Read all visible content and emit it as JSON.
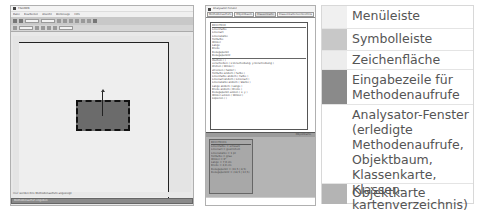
{
  "left_window": {
    "title": "FIGUREN",
    "menu": [
      "Datei",
      "Bearbeiten",
      "Ansicht",
      "Werkzeuge",
      "Hilfe"
    ],
    "toolbar": {
      "field1": "",
      "field2": ""
    },
    "status_text": "Hier werden Ihre Methodenaufrufe angezeigt",
    "input_text": "Methodenaufruf eingeben"
  },
  "right_window": {
    "title": "Analysator-Fenster",
    "tabs": [
      "Methodenaufrufe",
      "Objektbaum",
      "Klassenkarte",
      "Klassenkartenverzeichnis"
    ],
    "active_tab": 2,
    "class_card": {
      "name": "RECHTECK",
      "attributes": [
        "Linienfarbe",
        "Linienart",
        "Linienstärke",
        "Füllfarbe",
        "Winkel",
        "Länge",
        "Breite",
        "Bezugspunkt",
        "Bezugspunkt2"
      ],
      "methods": [
        "löschen ( )",
        "verschieben ( x-Verschiebung, y-Verschiebung )",
        "drehen ( Winkel )",
        "strecken ( Faktor )",
        "Füllfarbe ändern ( Farbe )",
        "Linienfarbe ändern ( Farbe )",
        "Linienart ändern ( Linienart )",
        "Linienstärke ändern ( Stärke )",
        "Länge ändern ( Länge )",
        "Breite ändern ( Breite )",
        "Bezugspunkt setzen ( x, y )",
        "Winkel setzen ( Winkel )",
        "kopieren ( )"
      ]
    },
    "object_panel_header": "Objektkarte",
    "object_card": {
      "name": "RECHTECK1",
      "attributes": [
        "Linienfarbe = schwarz",
        "Linienart = gestrichelt",
        "Linienstärke = 1 pt",
        "Füllfarbe = grau",
        "Winkel = 0°",
        "Länge = 7,0 cm",
        "Breite = 4,0 cm",
        "Bezugspunkt = (11,5 | 8,5)",
        "Bezugspunkt2 = (18,5 | 12,5)"
      ]
    }
  },
  "legend": {
    "items": [
      {
        "label": "Menüleiste",
        "color": "#f0f0f0"
      },
      {
        "label": "Symbolleiste",
        "color": "#c8c8c8"
      },
      {
        "label": "Zeichenfläche",
        "color": "#ededed"
      },
      {
        "label": "Eingabezeile für Methodenaufrufe",
        "color": "#8a8a8a"
      },
      {
        "label": "Analysator-Fenster (erledigte Methoden­aufrufe, Objektbaum, Klassenkarte, Klassen­kartenverzeichnis)",
        "color": "#ffffff"
      },
      {
        "label": "Objektkarte",
        "color": "#b4b4b4"
      }
    ]
  }
}
